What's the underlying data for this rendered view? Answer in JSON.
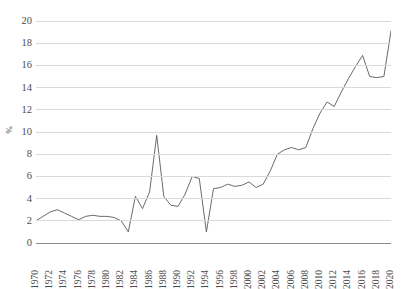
{
  "chart_data": {
    "type": "line",
    "title": "",
    "xlabel": "",
    "ylabel": "%",
    "ylim": [
      0,
      20
    ],
    "ytick_step": 2,
    "yticks": [
      20,
      18,
      16,
      14,
      12,
      10,
      8,
      6,
      4,
      2,
      0
    ],
    "xlim": [
      1970,
      2020
    ],
    "xtick_step": 2,
    "xticks": [
      "1970",
      "1972",
      "1974",
      "1976",
      "1978",
      "1980",
      "1982",
      "1984",
      "1986",
      "1988",
      "1990",
      "1992",
      "1994",
      "1996",
      "1998",
      "2000",
      "2002",
      "2004",
      "2006",
      "2008",
      "2010",
      "2012",
      "2014",
      "2016",
      "2018",
      "2020"
    ],
    "grid": true,
    "legend": false,
    "legend_position": "none",
    "line_color": "#595959",
    "grid_color": "#d9d9d9",
    "axis_color": "#8c8c8c",
    "background_color": "#ffffff",
    "x": [
      1970,
      1971,
      1972,
      1973,
      1974,
      1975,
      1976,
      1977,
      1978,
      1979,
      1980,
      1981,
      1982,
      1983,
      1984,
      1985,
      1986,
      1987,
      1988,
      1989,
      1990,
      1991,
      1992,
      1993,
      1994,
      1995,
      1996,
      1997,
      1998,
      1999,
      2000,
      2001,
      2002,
      2003,
      2004,
      2005,
      2006,
      2007,
      2008,
      2009,
      2010,
      2011,
      2012,
      2013,
      2014,
      2015,
      2016,
      2017,
      2018,
      2019,
      2020
    ],
    "series": [
      {
        "name": "value",
        "values": [
          2.0,
          2.4,
          2.8,
          3.0,
          2.7,
          2.4,
          2.1,
          2.4,
          2.5,
          2.4,
          2.4,
          2.3,
          2.0,
          1.0,
          4.2,
          3.1,
          4.6,
          9.7,
          4.2,
          3.4,
          3.3,
          4.4,
          6.0,
          5.8,
          1.0,
          4.9,
          5.0,
          5.3,
          5.1,
          5.2,
          5.5,
          5.0,
          5.3,
          6.5,
          8.0,
          8.4,
          8.6,
          8.4,
          8.6,
          10.3,
          11.7,
          12.7,
          12.3,
          13.6,
          14.8,
          15.9,
          16.9,
          15.0,
          14.9,
          15.0,
          19.1
        ]
      }
    ]
  }
}
